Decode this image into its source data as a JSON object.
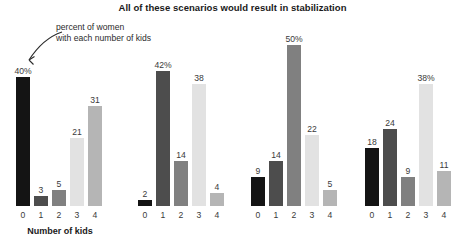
{
  "chart_data": {
    "type": "bar",
    "title": "All of these scenarios would result in stabilization",
    "xlabel": "Number of kids",
    "ylabel": "",
    "ylim": [
      0,
      54
    ],
    "grid": false,
    "legend": "none",
    "categories": [
      "0",
      "1",
      "2",
      "3",
      "4"
    ],
    "annotation": {
      "line1": "percent of women",
      "line2": "with each number of kids",
      "points_to": "40%"
    },
    "bar_colors": [
      "#141414",
      "#4d4d4d",
      "#808080",
      "#e2e2e2",
      "#b5b5b5"
    ],
    "panels": [
      {
        "name": "panel-1",
        "values": [
          40,
          3,
          5,
          21,
          31
        ],
        "labels": [
          "40%",
          "3",
          "5",
          "21",
          "31"
        ]
      },
      {
        "name": "panel-2",
        "values": [
          2,
          42,
          14,
          38,
          4
        ],
        "labels": [
          "2",
          "42%",
          "14",
          "38",
          "4"
        ]
      },
      {
        "name": "panel-3",
        "values": [
          9,
          14,
          50,
          22,
          5
        ],
        "labels": [
          "9",
          "14",
          "50%",
          "22",
          "5"
        ]
      },
      {
        "name": "panel-4",
        "values": [
          18,
          24,
          9,
          38,
          11
        ],
        "labels": [
          "18",
          "24",
          "9",
          "38%",
          "11"
        ]
      }
    ]
  },
  "axis": {
    "title": "Number of kids"
  }
}
